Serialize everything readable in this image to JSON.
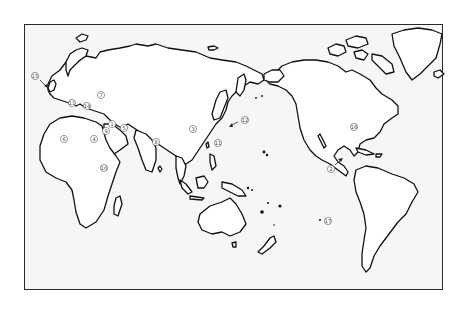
{
  "map": {
    "title": "",
    "projection": "pacific-centered world outline",
    "colors": {
      "land": "#ffffff",
      "ocean": "#f6f6f6",
      "outline": "#111111",
      "frame": "#2a2a2a"
    },
    "markers": [
      {
        "id": 1,
        "label": "①",
        "region": "Middle East (Syria/Iraq)"
      },
      {
        "id": 2,
        "label": "②",
        "region": "Mexico (Pacific coast)",
        "has_arrow": true
      },
      {
        "id": 3,
        "label": "③",
        "region": "China"
      },
      {
        "id": 4,
        "label": "④",
        "region": "Egypt"
      },
      {
        "id": 5,
        "label": "⑤",
        "region": "Iran"
      },
      {
        "id": 6,
        "label": "⑥",
        "region": "West Africa"
      },
      {
        "id": 7,
        "label": "⑦",
        "region": "Black Sea region"
      },
      {
        "id": 8,
        "label": "⑧",
        "region": "India"
      },
      {
        "id": 9,
        "label": "⑨",
        "region": "Eastern Mediterranean (Levant)"
      },
      {
        "id": 10,
        "label": "⑩",
        "region": "East Africa"
      },
      {
        "id": 11,
        "label": "⑪",
        "region": "Korea / Japan and Western Europe",
        "occurrences": 2
      },
      {
        "id": 12,
        "label": "⑫",
        "region": "Japan (Pacific side)",
        "has_arrow": true
      },
      {
        "id": 13,
        "label": "⑬",
        "region": "Central Europe"
      },
      {
        "id": 14,
        "label": "⑭",
        "region": "Italy / Balkans"
      },
      {
        "id": 15,
        "label": "⑮",
        "region": "British Isles",
        "has_arrow": true
      },
      {
        "id": 16,
        "label": "⑯",
        "region": "Eastern North America"
      },
      {
        "id": 17,
        "label": "⑰",
        "region": "South Pacific (Easter Island)"
      }
    ]
  }
}
